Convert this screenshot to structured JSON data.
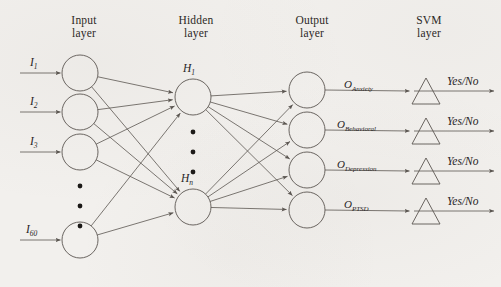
{
  "diagram": {
    "background_color": "#f2f0ed",
    "line_color": "#5a5550",
    "text_color": "#26231f"
  },
  "headers": [
    {
      "name": "input-layer-header",
      "line1": "Input",
      "line2": "layer",
      "x": 84,
      "y": 14
    },
    {
      "name": "hidden-layer-header",
      "line1": "Hidden",
      "line2": "layer",
      "x": 196,
      "y": 14
    },
    {
      "name": "output-layer-header",
      "line1": "Output",
      "line2": "layer",
      "x": 312,
      "y": 14
    },
    {
      "name": "svm-layer-header",
      "line1": "SVM",
      "line2": "layer",
      "x": 429,
      "y": 14
    }
  ],
  "input_layer": {
    "node_radius": 18,
    "center_x": 80,
    "nodes": [
      {
        "label_base": "I",
        "label_sub": "1",
        "cy": 73,
        "label_x": 30,
        "label_y": 56
      },
      {
        "label_base": "I",
        "label_sub": "2",
        "cy": 112,
        "label_x": 30,
        "label_y": 95
      },
      {
        "label_base": "I",
        "label_sub": "3",
        "cy": 152,
        "label_x": 30,
        "label_y": 135
      },
      {
        "label_base": "I",
        "label_sub": "60",
        "cy": 240,
        "label_x": 26,
        "label_y": 223
      }
    ],
    "ellipsis_dots_y": [
      186,
      206,
      226
    ],
    "arrow_start_x": 20
  },
  "hidden_layer": {
    "node_radius": 18,
    "center_x": 193,
    "nodes": [
      {
        "label_base": "H",
        "label_sub": "1",
        "cy": 97,
        "label_x": 183,
        "label_y": 62
      },
      {
        "label_base": "H",
        "label_sub": "n",
        "cy": 207,
        "label_x": 181,
        "label_y": 172
      }
    ],
    "ellipsis_dots_y": [
      132,
      152,
      172
    ]
  },
  "output_layer": {
    "node_radius": 18,
    "center_x": 307,
    "nodes": [
      {
        "cy": 90
      },
      {
        "cy": 130
      },
      {
        "cy": 170
      },
      {
        "cy": 210
      }
    ]
  },
  "output_labels": [
    {
      "name": "output-label-anxiety",
      "base": "O",
      "sub": "Anxiety",
      "x": 344,
      "y": 78
    },
    {
      "name": "output-label-behavioral",
      "base": "O",
      "sub": "Behavioral",
      "x": 337,
      "y": 118
    },
    {
      "name": "output-label-depression",
      "base": "O",
      "sub": "Depression",
      "x": 337,
      "y": 158
    },
    {
      "name": "output-label-ptsd",
      "base": "O",
      "sub": "PTSD",
      "x": 344,
      "y": 198
    }
  ],
  "svm_layer": {
    "triangle_half_width": 14,
    "triangle_height": 26,
    "center_x": 426,
    "triangles": [
      {
        "baseline_y": 104
      },
      {
        "baseline_y": 144
      },
      {
        "baseline_y": 184
      },
      {
        "baseline_y": 224
      }
    ],
    "verdict_label": "Yes/No",
    "verdict_positions": [
      {
        "x": 447,
        "y": 75
      },
      {
        "x": 447,
        "y": 115
      },
      {
        "x": 447,
        "y": 155
      },
      {
        "x": 447,
        "y": 195
      }
    ],
    "arrow_end_x": 494
  }
}
